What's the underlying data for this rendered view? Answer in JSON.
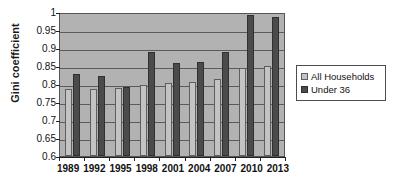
{
  "chart_data": {
    "type": "bar",
    "title": "",
    "xlabel": "",
    "ylabel": "Gini coefficient",
    "ylim": [
      0.6,
      1
    ],
    "ytick_step": 0.05,
    "yticks": [
      1,
      0.95,
      0.9,
      0.85,
      0.8,
      0.75,
      0.7,
      0.65,
      0.6
    ],
    "ytick_labels": [
      "1",
      "0.95",
      "0.9",
      "0.85",
      "0.8",
      "0.75",
      "0.7",
      "0.65",
      "0.6"
    ],
    "grid": true,
    "grid_axis": "y",
    "legend_position": "right",
    "plot_background": "#b2b2b2",
    "categories": [
      "1989",
      "1992",
      "1995",
      "1998",
      "2001",
      "2004",
      "2007",
      "2010",
      "2013"
    ],
    "series": [
      {
        "name": "All Households",
        "color": "#c3c3c3",
        "values": [
          0.787,
          0.785,
          0.789,
          0.797,
          0.803,
          0.806,
          0.813,
          0.845,
          0.849
        ]
      },
      {
        "name": "Under 36",
        "color": "#4b4b4b",
        "values": [
          0.828,
          0.821,
          0.792,
          0.889,
          0.859,
          0.862,
          0.888,
          0.992,
          0.986
        ]
      }
    ]
  },
  "legend": {
    "entries": [
      {
        "label": "All Households",
        "swatch": "legend-swatch-all-households"
      },
      {
        "label": "Under 36",
        "swatch": "legend-swatch-under-36"
      }
    ]
  }
}
